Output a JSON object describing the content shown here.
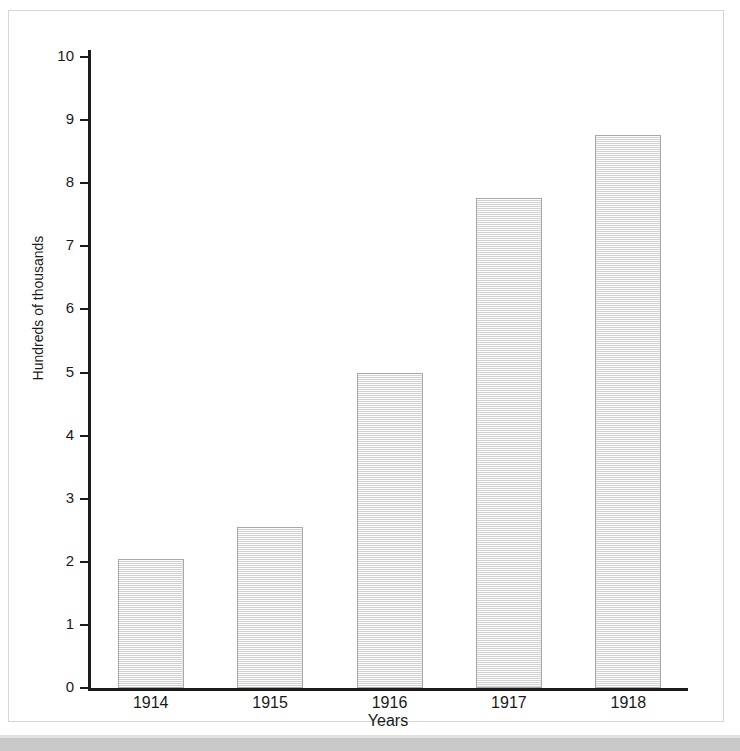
{
  "chart_data": {
    "type": "bar",
    "title": "",
    "subtitle": "",
    "xlabel": "Years",
    "ylabel": "Hundreds of thousands",
    "categories": [
      "1914",
      "1915",
      "1916",
      "1917",
      "1918"
    ],
    "values": [
      2.05,
      2.55,
      5.0,
      7.77,
      8.77
    ],
    "ylim": [
      0,
      10
    ],
    "y_ticks": [
      "0",
      "1",
      "2",
      "3",
      "4",
      "5",
      "6",
      "7",
      "8",
      "9",
      "10"
    ],
    "y_tick_values": [
      0,
      1,
      2,
      3,
      4,
      5,
      6,
      7,
      8,
      9,
      10
    ],
    "grid": false,
    "legend": false,
    "legend_position": "none",
    "bar_fill_color": "#e8e8e8",
    "bar_border_color": "#a8a8a8",
    "axis_color": "#1c1c1c",
    "plot_background": "#ffffff",
    "frame_border_color": "#d6d6d6"
  },
  "figure": {
    "background_band_color": "#c9c9c9"
  }
}
